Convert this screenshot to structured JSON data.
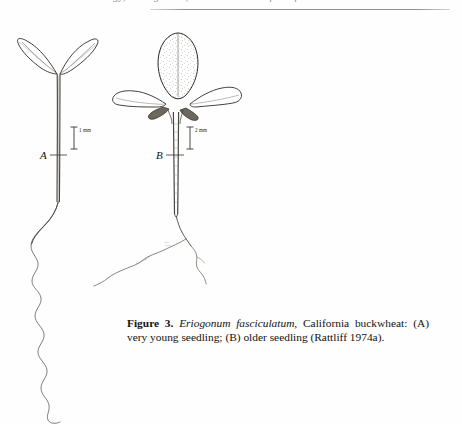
{
  "page": {
    "header_text": "Ecology, Management, and Restoration of California Grasslands",
    "background_color": "#ffffff",
    "ink_color": "#111111"
  },
  "figure": {
    "number_label": "Figure 3.",
    "species_name": "Eriogonum fasciculatum,",
    "caption_rest": " California buckwheat: (A) very young seedling; (B) older seedling (Rattliff 1974a).",
    "citation": "Rattliff 1974a",
    "common_name": "California buckwheat",
    "panels": [
      {
        "id": "A",
        "label": "A",
        "description": "very young seedling",
        "scale_label": "1 mm",
        "features": [
          "two curved narrow cotyledons",
          "slender hypocotyl",
          "long wavy unbranched taproot"
        ]
      },
      {
        "id": "B",
        "label": "B",
        "description": "older seedling",
        "scale_label": "2 mm",
        "features": [
          "stippled ovate true leaf",
          "two elongate spatulate cotyledons",
          "branched root with lateral roots"
        ]
      }
    ]
  }
}
